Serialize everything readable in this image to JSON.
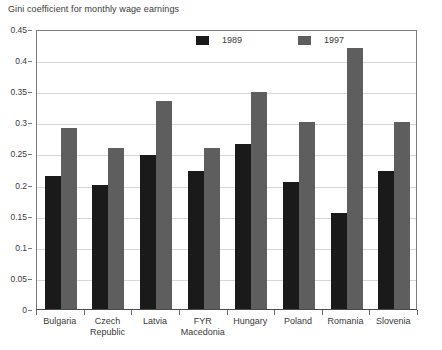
{
  "chart_data": {
    "type": "bar",
    "title": "Gini coefficient for monthly wage earnings",
    "xlabel": "",
    "ylabel": "",
    "ylim": [
      0,
      0.45
    ],
    "y_ticks": [
      "0",
      "0.05",
      "0.1",
      "0.15",
      "0.2",
      "0.25",
      "0.3",
      "0.35",
      "0.4",
      "0.45"
    ],
    "y_tick_values": [
      0,
      0.05,
      0.1,
      0.15,
      0.2,
      0.25,
      0.3,
      0.35,
      0.4,
      0.45
    ],
    "grid": "horizontal",
    "legend_position": "top-center",
    "categories": [
      "Bulgaria",
      "Czech\nRepublic",
      "Latvia",
      "FYR\nMacedonia",
      "Hungary",
      "Poland",
      "Romania",
      "Slovenia"
    ],
    "series": [
      {
        "name": "1989",
        "color": "#1a1a1a",
        "values": [
          0.213,
          0.199,
          0.248,
          0.222,
          0.266,
          0.204,
          0.155,
          0.222
        ]
      },
      {
        "name": "1997",
        "color": "#5e5e5e",
        "values": [
          0.291,
          0.259,
          0.334,
          0.258,
          0.348,
          0.3,
          0.42,
          0.301
        ]
      }
    ]
  },
  "legend": {
    "items": [
      {
        "label": "1989",
        "color": "#1a1a1a"
      },
      {
        "label": "1997",
        "color": "#5e5e5e"
      }
    ]
  },
  "colors": {
    "series_1989": "#1a1a1a",
    "series_1997": "#5e5e5e",
    "gridline": "#d6d6d6",
    "axis": "#7a7a7a",
    "text": "#3a3a3a",
    "background": "#ffffff"
  }
}
